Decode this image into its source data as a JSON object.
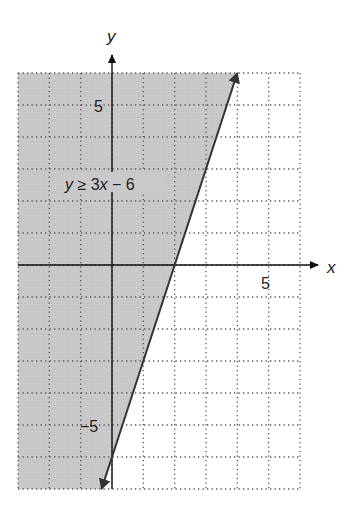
{
  "chart_data": {
    "type": "line",
    "title": "",
    "inequality_label": "y ≥ 3x − 6",
    "xlabel": "x",
    "ylabel": "y",
    "xlim": [
      -3,
      6
    ],
    "ylim": [
      -7,
      6
    ],
    "grid": true,
    "grid_style": "dotted",
    "tick_labels": {
      "x": [
        {
          "value": 5,
          "label": "5"
        }
      ],
      "y": [
        {
          "value": 5,
          "label": "5"
        },
        {
          "value": -5,
          "label": "−5"
        }
      ]
    },
    "boundary_line": {
      "equation": "y = 3x - 6",
      "slope": 3,
      "intercept": -6,
      "style": "solid",
      "arrows": "both",
      "points": [
        [
          -0.3333,
          -7
        ],
        [
          4,
          6
        ]
      ]
    },
    "shaded_region": "left/above of line (y ≥ 3x − 6)",
    "colors": {
      "shade": "#c8c8c8",
      "line": "#333333",
      "grid": "#555555",
      "axis": "#111111"
    }
  },
  "labels": {
    "x_axis": "x",
    "y_axis": "y",
    "x_tick_5": "5",
    "y_tick_5": "5",
    "y_tick_neg5": "−5",
    "y_prefix": "y",
    "inequality_rest": " ≥ 3",
    "x_var": "x",
    "inequality_tail": " − 6"
  }
}
